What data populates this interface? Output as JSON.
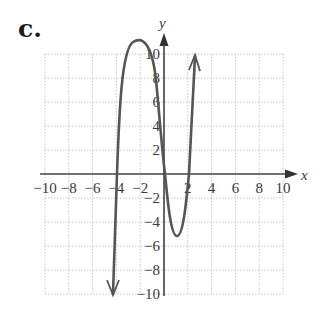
{
  "panel_label": "c.",
  "chart_data": {
    "type": "line",
    "title": "",
    "xlabel": "x",
    "ylabel": "y",
    "xlim": [
      -10,
      10
    ],
    "ylim": [
      -10,
      10
    ],
    "grid": true,
    "grid_step": 2,
    "x_ticks": [
      -10,
      -8,
      -6,
      -4,
      -2,
      2,
      4,
      6,
      8,
      10
    ],
    "y_ticks": [
      -10,
      -8,
      -6,
      -4,
      -2,
      2,
      4,
      6,
      8,
      10
    ],
    "x_tick_labels": [
      "−10",
      "−8",
      "−6",
      "−4",
      "−2",
      "2",
      "4",
      "6",
      "8",
      "10"
    ],
    "y_tick_labels": [
      "−10",
      "−8",
      "−6",
      "−4",
      "−2",
      "2",
      "4",
      "6",
      "8",
      "10"
    ],
    "series": [
      {
        "name": "f(x)",
        "color": "#555555",
        "arrows_at_ends": true,
        "points": [
          {
            "x": -4.3,
            "y": -10
          },
          {
            "x": -4,
            "y": 0
          },
          {
            "x": -3.5,
            "y": 8
          },
          {
            "x": -2.3,
            "y": 11
          },
          {
            "x": -1,
            "y": 8
          },
          {
            "x": 0.1,
            "y": 0
          },
          {
            "x": 1,
            "y": -5.2
          },
          {
            "x": 2,
            "y": 0
          },
          {
            "x": 2.6,
            "y": 10
          }
        ],
        "zeros": [
          -4,
          0,
          2
        ],
        "local_max": {
          "x": -2.3,
          "y": 11
        },
        "local_min": {
          "x": 1,
          "y": -5.2
        }
      }
    ]
  },
  "colors": {
    "grid": "#c8c8c8",
    "axis": "#444444",
    "curve": "#555555",
    "text": "#3a3a3a"
  }
}
